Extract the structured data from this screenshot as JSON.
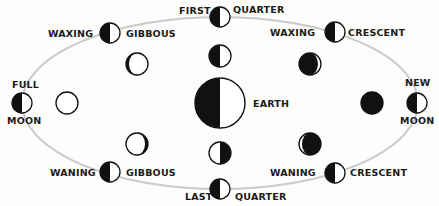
{
  "colors": {
    "background": "#fdfdfb",
    "ink": "#111111",
    "orbit": "#c9c9c9",
    "lit": "#ffffff"
  },
  "earth": {
    "label": "EARTH",
    "cx": 220,
    "cy": 103,
    "r": 25
  },
  "orbit": {
    "cx": 220,
    "cy": 103,
    "rx": 198,
    "ry": 86
  },
  "phases": [
    {
      "id": "full-moon",
      "label_a": "FULL",
      "label_b": "MOON",
      "orbit_pos": [
        22,
        103
      ],
      "view_pos": [
        67,
        103
      ],
      "view": "full"
    },
    {
      "id": "waxing-gibbous",
      "label_a": "WAXING",
      "label_b": "GIBBOUS",
      "orbit_pos": [
        110,
        33
      ],
      "view_pos": [
        137,
        64
      ],
      "view": "gibbous-right-dark"
    },
    {
      "id": "first-quarter",
      "label_a": "FIRST",
      "label_b": "QUARTER",
      "orbit_pos": [
        220,
        17
      ],
      "view_pos": [
        220,
        56
      ],
      "view": "half-left-dark"
    },
    {
      "id": "waxing-crescent",
      "label_a": "WAXING",
      "label_b": "CRESCENT",
      "orbit_pos": [
        335,
        32
      ],
      "view_pos": [
        310,
        64
      ],
      "view": "crescent-right-lit"
    },
    {
      "id": "new-moon",
      "label_a": "NEW",
      "label_b": "MOON",
      "orbit_pos": [
        417,
        103
      ],
      "view_pos": [
        372,
        103
      ],
      "view": "new"
    },
    {
      "id": "waning-crescent",
      "label_a": "WANING",
      "label_b": "CRESCENT",
      "orbit_pos": [
        335,
        173
      ],
      "view_pos": [
        310,
        144
      ],
      "view": "crescent-left-lit"
    },
    {
      "id": "last-quarter",
      "label_a": "LAST",
      "label_b": "QUARTER",
      "orbit_pos": [
        220,
        189
      ],
      "view_pos": [
        220,
        153
      ],
      "view": "half-right-dark"
    },
    {
      "id": "waning-gibbous",
      "label_a": "WANING",
      "label_b": "GIBBOUS",
      "orbit_pos": [
        110,
        172
      ],
      "view_pos": [
        137,
        144
      ],
      "view": "gibbous-left-dark"
    }
  ],
  "labels": {
    "full_top": "FULL",
    "full_bottom": "MOON",
    "new_top": "NEW",
    "new_bottom": "MOON",
    "wg_top_left": "WAXING",
    "wg_top_right": "GIBBOUS",
    "fq_left": "FIRST",
    "fq_right": "QUARTER",
    "wc_top_left": "WAXING",
    "wc_top_right": "CRESCENT",
    "wg_bottom_left": "WANING",
    "wg_bottom_right": "GIBBOUS",
    "lq_left": "LAST",
    "lq_right": "QUARTER",
    "wc_bottom_left": "WANING",
    "wc_bottom_right": "CRESCENT",
    "earth": "EARTH"
  }
}
